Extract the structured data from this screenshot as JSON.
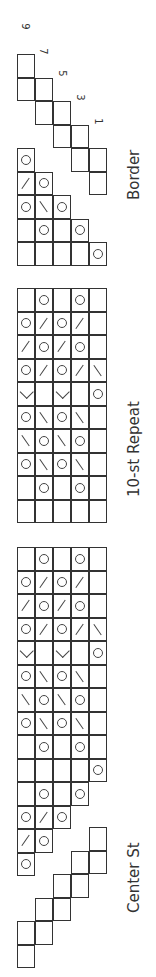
{
  "chart_data": {
    "type": "knitting_chart",
    "orientation": "rotated 90 degrees",
    "sections": [
      {
        "name": "Border",
        "label": "Border"
      },
      {
        "name": "10-st Repeat",
        "label": "10-st Repeat"
      },
      {
        "name": "Center St",
        "label": "Center St"
      }
    ],
    "row_numbers": [
      "1",
      "3",
      "5",
      "7",
      "9"
    ],
    "legend_symbols": {
      "O": "yarn over",
      "/": "k2tog",
      "\\": "ssk",
      "<": "double decrease",
      "": "knit"
    }
  },
  "labels": {
    "border": "Border",
    "repeat": "10-st Repeat",
    "center": "Center St"
  },
  "row_numbers": [
    {
      "text": "9",
      "x": 19,
      "y": 21
    },
    {
      "text": "7",
      "x": 37,
      "y": 46
    },
    {
      "text": "5",
      "x": 56,
      "y": 68
    },
    {
      "text": "3",
      "x": 74,
      "y": 92
    },
    {
      "text": "1",
      "x": 92,
      "y": 116
    }
  ]
}
